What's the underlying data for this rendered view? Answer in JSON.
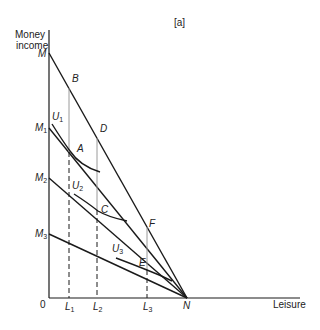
{
  "figure": {
    "panel_label": "[a]",
    "y_axis_label_line1": "Money",
    "y_axis_label_line2": "income",
    "x_axis_label": "Leisure",
    "origin_label": "0"
  },
  "points": {
    "M": "M",
    "M1": "M",
    "M1_sub": "1",
    "M2": "M",
    "M2_sub": "2",
    "M3": "M",
    "M3_sub": "3",
    "N": "N",
    "A": "A",
    "B": "B",
    "C": "C",
    "D": "D",
    "E": "E",
    "F": "F"
  },
  "curves": {
    "U1": "U",
    "U1_sub": "1",
    "U2": "U",
    "U2_sub": "2",
    "U3": "U",
    "U3_sub": "3"
  },
  "x_ticks": {
    "L1": "L",
    "L1_sub": "1",
    "L2": "L",
    "L2_sub": "2",
    "L3": "L",
    "L3_sub": "3"
  },
  "colors": {
    "line": "#1a1a1a",
    "guide": "#9a9a9a"
  }
}
